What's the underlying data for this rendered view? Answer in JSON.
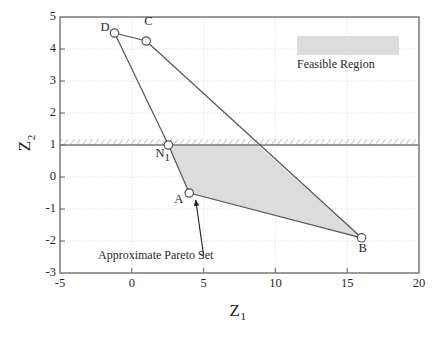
{
  "figure": {
    "background": "#ffffff",
    "plot_line_color": "#6e6e6e",
    "shade_color": "#dcdcdc",
    "text_color": "#1f1f1f"
  },
  "axes": {
    "x_label": "Z",
    "x_label_sub": "1",
    "y_label": "Z",
    "y_label_sub": "2",
    "x_ticks": [
      "-5",
      "0",
      "5",
      "10",
      "15",
      "20"
    ],
    "y_ticks": [
      "5",
      "4",
      "3",
      "2",
      "1",
      "0",
      "-1",
      "-2",
      "-3"
    ],
    "xlim": [
      -5,
      20
    ],
    "ylim": [
      -3,
      5
    ],
    "grid": "dotted"
  },
  "legend": {
    "feasible_region_label": "Feasible Region",
    "swatch_color": "#dcdcdc"
  },
  "annotations": {
    "pareto_set_label": "Approximate Pareto Set"
  },
  "chart_data": {
    "type": "scatter",
    "title": "",
    "xlabel": "Z1",
    "ylabel": "Z2",
    "xlim": [
      -5,
      20
    ],
    "ylim": [
      -3,
      5
    ],
    "grid": true,
    "legend_position": "top-right",
    "points": [
      {
        "label": "D",
        "x": -1.2,
        "y": 4.5,
        "label_dx": -14,
        "label_dy": -5
      },
      {
        "label": "C",
        "x": 1.0,
        "y": 4.25,
        "label_dx": -2,
        "label_dy": -19
      },
      {
        "label": "N1",
        "x": 2.55,
        "y": 1.0,
        "label_dx": -13,
        "label_dy": 9
      },
      {
        "label": "A",
        "x": 4.0,
        "y": -0.5,
        "label_dx": -15,
        "label_dy": 7
      },
      {
        "label": "B",
        "x": 16.0,
        "y": -1.9,
        "label_dx": -3,
        "label_dy": 11
      }
    ],
    "series": [
      {
        "name": "D-C edge",
        "x": [
          -1.2,
          1.0
        ],
        "y": [
          4.5,
          4.25
        ]
      },
      {
        "name": "D-N1-A edge",
        "x": [
          -1.2,
          2.55,
          4.0
        ],
        "y": [
          4.5,
          1.0,
          -0.5
        ]
      },
      {
        "name": "C-B edge",
        "x": [
          1.0,
          16.0
        ],
        "y": [
          4.25,
          -1.9
        ]
      },
      {
        "name": "A-B edge",
        "x": [
          4.0,
          16.0
        ],
        "y": [
          -0.5,
          -1.9
        ]
      }
    ],
    "constraint_line": {
      "name": "Z2 >= 1 constraint",
      "y": 1.0,
      "style": "hatched"
    },
    "shaded_polygon": {
      "name": "Feasible Region",
      "x": [
        2.55,
        8.72,
        16.0,
        4.0
      ],
      "y": [
        1.0,
        1.0,
        -1.9,
        -0.5
      ]
    },
    "arrow": {
      "from_x": 5.0,
      "from_y": -2.45,
      "to_x": 4.45,
      "to_y": -0.72
    }
  }
}
